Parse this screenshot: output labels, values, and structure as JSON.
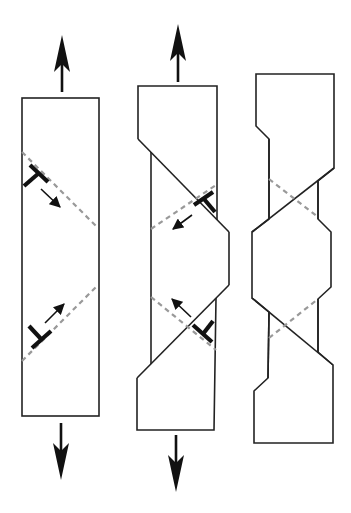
{
  "figure": {
    "title": "Dislocation glide producing slip steps in a tensile specimen",
    "colors": {
      "outline": "#222222",
      "slip_plane": "#999999",
      "dislocation": "#111111",
      "background": "#ffffff"
    },
    "panels": [
      {
        "id": "initial",
        "description": "Undeformed bar under tension with two edge dislocations on inclined slip planes",
        "load_arrows": [
          "up",
          "down"
        ],
        "slip_planes": 2,
        "dislocations": [
          {
            "symbol": "T",
            "position": "upper",
            "glide_direction": "down-right"
          },
          {
            "symbol": "inverted-T",
            "position": "lower",
            "glide_direction": "up-right"
          }
        ]
      },
      {
        "id": "intermediate",
        "description": "Bar with slip offsets forming as dislocations glide out",
        "load_arrows": [
          "up",
          "down"
        ],
        "slip_planes": 2,
        "dislocations": [
          {
            "symbol": "T",
            "position": "upper",
            "glide_direction": "down-left"
          },
          {
            "symbol": "inverted-T",
            "position": "lower",
            "glide_direction": "up-left"
          }
        ]
      },
      {
        "id": "final",
        "description": "Deformed bar with necked central section after slip",
        "load_arrows": [],
        "slip_planes": 2,
        "dislocations": []
      }
    ]
  }
}
